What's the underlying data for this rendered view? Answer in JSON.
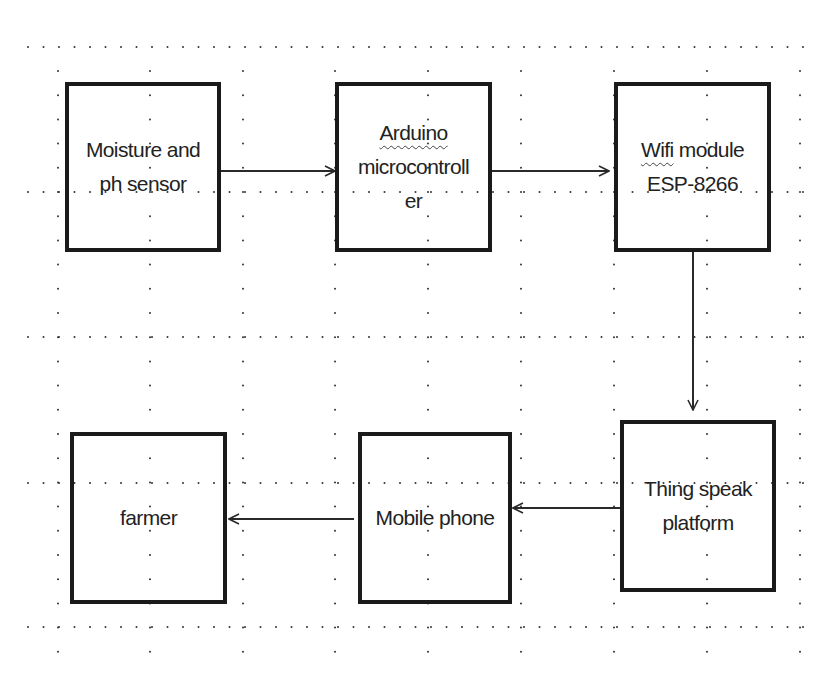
{
  "diagram": {
    "type": "block-diagram",
    "background": "#ffffff",
    "stroke_color": "#1a1a1a",
    "grid": {
      "style": "dotted",
      "row_y": [
        47,
        192,
        337,
        483,
        627
      ],
      "col_x": [
        58,
        150,
        243,
        335,
        428,
        521,
        614,
        707,
        800
      ]
    },
    "nodes": [
      {
        "id": "sensor",
        "lines": [
          "Moisture and",
          "ph sensor"
        ],
        "x": 65,
        "y": 82,
        "w": 156,
        "h": 170
      },
      {
        "id": "arduino",
        "lines": [
          "Arduino",
          "microcontroll",
          "er"
        ],
        "x": 335,
        "y": 82,
        "w": 157,
        "h": 170
      },
      {
        "id": "wifi",
        "lines": [
          "Wifi module",
          "ESP-8266"
        ],
        "x": 614,
        "y": 82,
        "w": 157,
        "h": 170
      },
      {
        "id": "thingspeak",
        "lines": [
          "Thing speak",
          "platform"
        ],
        "x": 620,
        "y": 420,
        "w": 156,
        "h": 172
      },
      {
        "id": "mobile",
        "lines": [
          "Mobile phone"
        ],
        "x": 358,
        "y": 432,
        "w": 154,
        "h": 172
      },
      {
        "id": "farmer",
        "lines": [
          "farmer"
        ],
        "x": 70,
        "y": 432,
        "w": 157,
        "h": 172
      }
    ],
    "edges": [
      {
        "from": "sensor",
        "to": "arduino",
        "direction": "right"
      },
      {
        "from": "arduino",
        "to": "wifi",
        "direction": "right"
      },
      {
        "from": "wifi",
        "to": "thingspeak",
        "direction": "down"
      },
      {
        "from": "thingspeak",
        "to": "mobile",
        "direction": "left"
      },
      {
        "from": "mobile",
        "to": "farmer",
        "direction": "left"
      }
    ]
  },
  "labels": {
    "sensor": {
      "line1": "Moisture and",
      "line2": "ph sensor"
    },
    "arduino": {
      "line1": "Arduino",
      "line2": "microcontroll",
      "line3": "er"
    },
    "wifi": {
      "line1_word1": "Wifi",
      "line1_word2": " module",
      "line2": "ESP-8266"
    },
    "thingspeak": {
      "line1": "Thing speak",
      "line2": "platform"
    },
    "mobile": {
      "line1": "Mobile phone"
    },
    "farmer": {
      "line1": "farmer"
    }
  }
}
